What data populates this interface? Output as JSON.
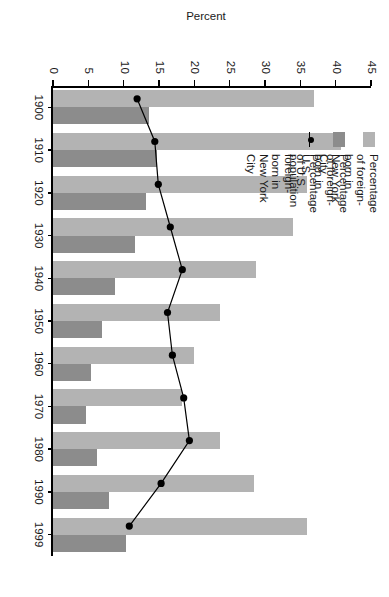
{
  "chart_data": {
    "type": "bar",
    "title": "",
    "subtitle": "",
    "xlabel": "",
    "ylabel": "Percent",
    "ylim": [
      0,
      45
    ],
    "yticks": [
      0,
      5,
      10,
      15,
      20,
      25,
      30,
      35,
      40,
      45
    ],
    "ytick_labels": [
      "0",
      "5",
      "10",
      "15",
      "20",
      "25",
      "30",
      "35",
      "40",
      "45"
    ],
    "grid": false,
    "orientation": "rotated-90-clockwise",
    "legend_position": "top-left",
    "categories": [
      "1900",
      "1910",
      "1920",
      "1930",
      "1940",
      "1950",
      "1960",
      "1970",
      "1980",
      "1990",
      "1999"
    ],
    "series": [
      {
        "name": "Percentage of foreign-born in\nNew York City",
        "short_name": "nyc-foreign-born",
        "kind": "bar",
        "color": "#b3b3b3",
        "values": [
          37.0,
          40.8,
          35.9,
          34.0,
          28.7,
          23.6,
          20.0,
          18.2,
          23.6,
          28.4,
          35.9
        ]
      },
      {
        "name": "Percentage of foreign-born in\nU.S. population",
        "short_name": "us-foreign-born",
        "kind": "bar",
        "color": "#8c8c8c",
        "values": [
          13.6,
          14.7,
          13.2,
          11.6,
          8.8,
          6.9,
          5.4,
          4.7,
          6.2,
          7.9,
          10.3
        ]
      },
      {
        "name": "Percentage of U.S. foreign-\nborn in New York City",
        "short_name": "share-of-us-foreign-born-in-nyc",
        "kind": "line",
        "color": "#000000",
        "marker": "filled-circle",
        "values": [
          11.9,
          14.4,
          14.9,
          16.6,
          18.3,
          16.2,
          16.9,
          18.5,
          19.3,
          15.3,
          10.8
        ]
      }
    ]
  },
  "legend": {
    "items": [
      {
        "label": "Percentage of foreign-born in\nNew York City",
        "swatch": "light-gray-swatch"
      },
      {
        "label": "Percentage of foreign-born in\nU.S. population",
        "swatch": "dark-gray-swatch"
      },
      {
        "label": "Percentage of U.S. foreign-\nborn in New York City",
        "swatch": "line-dot-marker"
      }
    ]
  }
}
